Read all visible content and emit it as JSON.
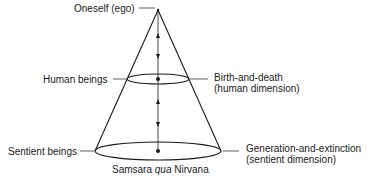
{
  "diagram": {
    "type": "cone",
    "apex_label": "Oneself (ego)",
    "levels": [
      {
        "left_label": "Human beings",
        "right_label_line1": "Birth-and-death",
        "right_label_line2": "(human dimension)"
      },
      {
        "left_label": "Sentient beings",
        "right_label_line1": "Generation-and-extinction",
        "right_label_line2": "(sentient dimension)"
      }
    ],
    "caption": {
      "before": "Samsara ",
      "italic": "qua",
      "after": " Nirvana"
    },
    "colors": {
      "line": "#1a1a1a",
      "background": "#ffffff"
    }
  }
}
